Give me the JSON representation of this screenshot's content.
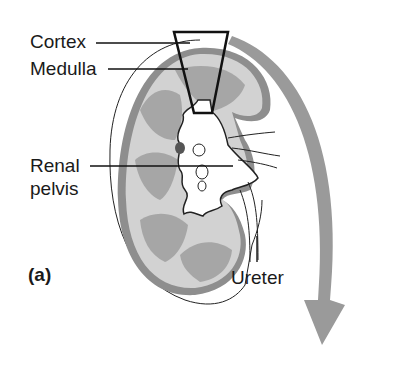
{
  "figure": {
    "panel_label": "(a)",
    "labels": {
      "cortex": "Cortex",
      "medulla": "Medulla",
      "renal_pelvis_line1": "Renal",
      "renal_pelvis_line2": "pelvis",
      "ureter": "Ureter"
    },
    "colors": {
      "cortex_fill": "#d4d4d4",
      "medulla_fill": "#a8a8a8",
      "capsule": "#8c8c8c",
      "arrow": "#9a9a9a",
      "line": "#111111"
    }
  }
}
